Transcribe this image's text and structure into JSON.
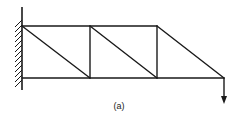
{
  "diagram": {
    "type": "cantilever-truss",
    "caption": "(a)",
    "colors": {
      "stroke": "#1a1a1a",
      "background": "#ffffff"
    },
    "support": {
      "type": "fixed-wall",
      "x": 22,
      "y_top": 7,
      "y_bottom": 90
    },
    "nodes": {
      "top": [
        [
          22,
          26
        ],
        [
          90,
          26
        ],
        [
          157,
          26
        ]
      ],
      "bottom": [
        [
          22,
          78
        ],
        [
          90,
          78
        ],
        [
          157,
          78
        ],
        [
          224,
          78
        ]
      ]
    },
    "members": [
      {
        "name": "top-chord",
        "from": [
          22,
          26
        ],
        "to": [
          157,
          26
        ]
      },
      {
        "name": "bottom-chord",
        "from": [
          22,
          78
        ],
        "to": [
          224,
          78
        ]
      },
      {
        "name": "vertical-1",
        "from": [
          90,
          26
        ],
        "to": [
          90,
          78
        ]
      },
      {
        "name": "vertical-2",
        "from": [
          157,
          26
        ],
        "to": [
          157,
          78
        ]
      },
      {
        "name": "diagonal-1",
        "from": [
          22,
          26
        ],
        "to": [
          90,
          78
        ]
      },
      {
        "name": "diagonal-2",
        "from": [
          90,
          26
        ],
        "to": [
          157,
          78
        ]
      },
      {
        "name": "diagonal-3",
        "from": [
          157,
          26
        ],
        "to": [
          224,
          78
        ]
      }
    ],
    "load": {
      "type": "point-load-downward",
      "at": [
        224,
        78
      ],
      "to": [
        224,
        103
      ]
    }
  }
}
